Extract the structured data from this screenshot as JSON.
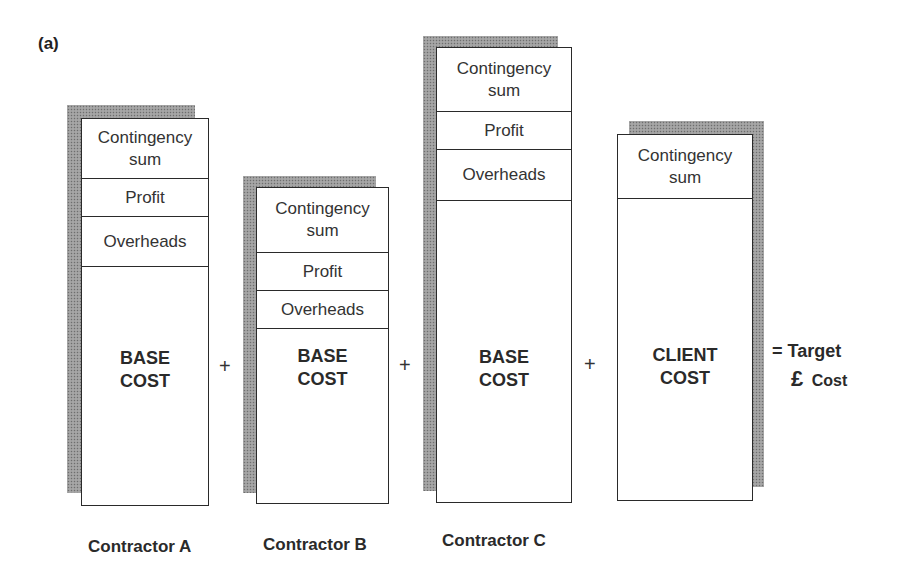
{
  "figure": {
    "panel_label": "(a)",
    "colors": {
      "line": "#2a2a2a",
      "shadow": "#9c9c9c",
      "background": "#ffffff"
    }
  },
  "contractors": [
    {
      "caption": "Contractor A",
      "segments": [
        "Contingency sum",
        "Profit",
        "Overheads"
      ],
      "base_line1": "BASE",
      "base_line2": "COST"
    },
    {
      "caption": "Contractor B",
      "segments": [
        "Contingency sum",
        "Profit",
        "Overheads"
      ],
      "base_line1": "BASE",
      "base_line2": "COST"
    },
    {
      "caption": "Contractor C",
      "segments": [
        "Contingency sum",
        "Profit",
        "Overheads"
      ],
      "base_line1": "BASE",
      "base_line2": "COST"
    }
  ],
  "client": {
    "segments": [
      "Contingency sum"
    ],
    "base_line1": "CLIENT",
    "base_line2": "COST"
  },
  "operators": {
    "plus": "+",
    "equals": "="
  },
  "result": {
    "line1": "Target",
    "currency_symbol": "£",
    "line2": "Cost"
  }
}
